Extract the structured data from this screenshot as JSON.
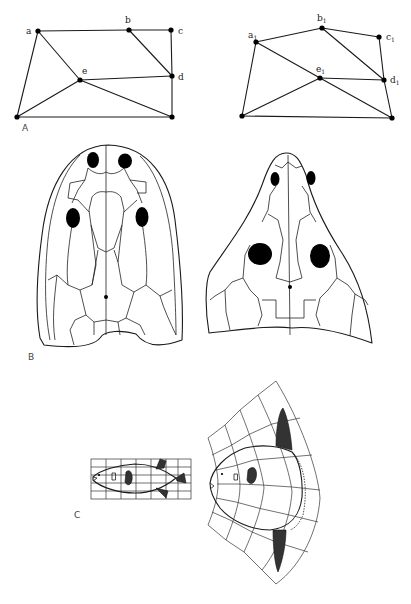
{
  "figure": {
    "panels": [
      {
        "id": "A",
        "label": "A",
        "description": "Point-to-point mapping between two quadrilateral grids",
        "left": {
          "points": [
            {
              "name": "a",
              "label": "a"
            },
            {
              "name": "b",
              "label": "b"
            },
            {
              "name": "c",
              "label": "c"
            },
            {
              "name": "d",
              "label": "d"
            },
            {
              "name": "e",
              "label": "e"
            }
          ]
        },
        "right": {
          "points": [
            {
              "name": "a1",
              "label": "a",
              "subscript": "1"
            },
            {
              "name": "b1",
              "label": "b",
              "subscript": "1"
            },
            {
              "name": "c1",
              "label": "c",
              "subscript": "1"
            },
            {
              "name": "d1",
              "label": "d",
              "subscript": "1"
            },
            {
              "name": "e1",
              "label": "e",
              "subscript": "1"
            }
          ]
        }
      },
      {
        "id": "B",
        "label": "B",
        "description": "Two skull roofs in dorsal view showing transformed bone pattern"
      },
      {
        "id": "C",
        "label": "C",
        "description": "Fish on rectangular grid transformed into deformed coordinate grid"
      }
    ]
  }
}
